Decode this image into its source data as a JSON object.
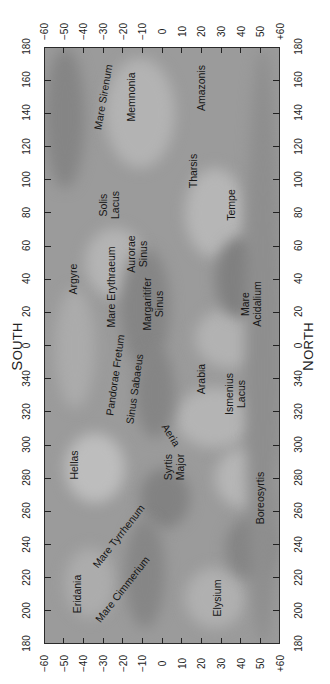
{
  "map": {
    "title": "Mars albedo map",
    "orientation": "rotated 90° counter-clockwise",
    "frame": {
      "lat_range": [
        -60,
        60
      ],
      "lon_top": 180,
      "lon_bottom": 180,
      "lon_direction": "decreasing downward through 0"
    },
    "colors": {
      "background": "#9b9b9b",
      "light": "#b9b9b9",
      "dark": "#7f7f7f",
      "frame": "#2a2a2a",
      "text": "#161616"
    }
  },
  "poles": {
    "south": {
      "first": "S",
      "rest": "OUTH"
    },
    "north": {
      "first": "N",
      "rest": "ORTH"
    }
  },
  "axes": {
    "latitude_ticks": [
      "−60",
      "−50",
      "−40",
      "−30",
      "−20",
      "−10",
      "0",
      "10",
      "20",
      "30",
      "40",
      "50",
      "+60"
    ],
    "longitude_ticks": [
      "180",
      "160",
      "140",
      "120",
      "100",
      "80",
      "60",
      "40",
      "20",
      "0",
      "340",
      "320",
      "300",
      "280",
      "260",
      "240",
      "220",
      "200",
      "180"
    ]
  },
  "features": [
    {
      "name": "Mare Sirenum",
      "lines": [
        "Mare Sirenum"
      ],
      "lat": -30,
      "lon": 150,
      "rot": -80
    },
    {
      "name": "Memnonia",
      "lines": [
        "Memnonia"
      ],
      "lat": -16,
      "lon": 150,
      "rot": -90
    },
    {
      "name": "Amazonis",
      "lines": [
        "Amazonis"
      ],
      "lat": 20,
      "lon": 155,
      "rot": -90
    },
    {
      "name": "Tharsis",
      "lines": [
        "Tharsis"
      ],
      "lat": 16,
      "lon": 105,
      "rot": -90
    },
    {
      "name": "Tempe",
      "lines": [
        "Tempe"
      ],
      "lat": 35,
      "lon": 85,
      "rot": -90
    },
    {
      "name": "Solis Lacus",
      "lines": [
        "Solis",
        "Lacus"
      ],
      "lat": -27,
      "lon": 85,
      "rot": -90
    },
    {
      "name": "Aurorae Sinus",
      "lines": [
        "Aurorae",
        "Sinus"
      ],
      "lat": -13,
      "lon": 55,
      "rot": -90
    },
    {
      "name": "Argyre",
      "lines": [
        "Argyre"
      ],
      "lat": -45,
      "lon": 40,
      "rot": -90
    },
    {
      "name": "Mare Erythraeum",
      "lines": [
        "Mare Erythraeum"
      ],
      "lat": -26,
      "lon": 35,
      "rot": -90
    },
    {
      "name": "Margaritifer Sinus",
      "lines": [
        "Margaritifer",
        "Sinus"
      ],
      "lat": -5,
      "lon": 25,
      "rot": -90
    },
    {
      "name": "Mare Acidalium",
      "lines": [
        "Mare",
        "Acidalium"
      ],
      "lat": 45,
      "lon": 25,
      "rot": -90
    },
    {
      "name": "Pandorae Fretum",
      "lines": [
        "Pandorae Fretum"
      ],
      "lat": -24,
      "lon": 342,
      "rot": -82
    },
    {
      "name": "Sinus Sabaeus",
      "lines": [
        "Sinus Sabaeus"
      ],
      "lat": -14,
      "lon": 334,
      "rot": -82
    },
    {
      "name": "Arabia",
      "lines": [
        "Arabia"
      ],
      "lat": 20,
      "lon": 340,
      "rot": -90
    },
    {
      "name": "Ismenius Lacus",
      "lines": [
        "Ismenius",
        "Lacus"
      ],
      "lat": 37,
      "lon": 331,
      "rot": -90
    },
    {
      "name": "Aeria",
      "lines": [
        "Aeria"
      ],
      "lat": 5,
      "lon": 306,
      "rot": 58
    },
    {
      "name": "Hellas",
      "lines": [
        "Hellas"
      ],
      "lat": -45,
      "lon": 288,
      "rot": -90
    },
    {
      "name": "Syrtis Major",
      "lines": [
        "Syrtis",
        "Major"
      ],
      "lat": 6,
      "lon": 287,
      "rot": -90
    },
    {
      "name": "Boreosyrtis",
      "lines": [
        "Boreosyrtis"
      ],
      "lat": 50,
      "lon": 268,
      "rot": -90
    },
    {
      "name": "Mare Tyrrhenum",
      "lines": [
        "Mare Tyrrhenum"
      ],
      "lat": -22,
      "lon": 245,
      "rot": -52
    },
    {
      "name": "Mare Cimmerium",
      "lines": [
        "Mare Cimmerium"
      ],
      "lat": -20,
      "lon": 213,
      "rot": -52
    },
    {
      "name": "Eridania",
      "lines": [
        "Eridania"
      ],
      "lat": -43,
      "lon": 210,
      "rot": -90
    },
    {
      "name": "Elysium",
      "lines": [
        "Elysium"
      ],
      "lat": 28,
      "lon": 208,
      "rot": -90
    }
  ]
}
